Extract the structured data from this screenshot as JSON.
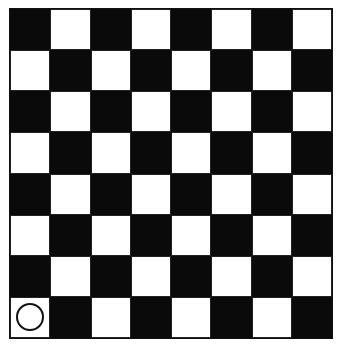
{
  "board": {
    "rows": 8,
    "cols": 8,
    "top_left_color": "dark",
    "colors": {
      "dark": "#0a0a0a",
      "light": "#ffffff"
    },
    "pieces": [
      {
        "row": 7,
        "col": 0,
        "type": "circle",
        "icon": "circle-piece-icon"
      }
    ]
  }
}
